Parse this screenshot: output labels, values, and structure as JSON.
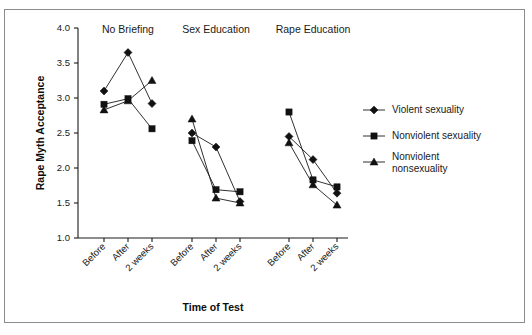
{
  "chart_data": {
    "type": "line",
    "title": "",
    "xlabel": "Time of Test",
    "ylabel": "Rape Myth Acceptance",
    "ylim": [
      1.0,
      4.0
    ],
    "ytick_labels": [
      "4.0",
      "3.5",
      "3.0",
      "2.5",
      "2.0",
      "1.5",
      "1.0"
    ],
    "ytick_values": [
      4.0,
      3.5,
      3.0,
      2.5,
      2.0,
      1.5,
      1.0
    ],
    "grid": false,
    "legend_position": "right",
    "categories": [
      "Before",
      "After",
      "2 weeks"
    ],
    "panels": [
      {
        "name": "No Briefing",
        "series": [
          {
            "name": "Violent sexuality",
            "marker": "diamond",
            "values": [
              3.1,
              3.65,
              2.92
            ]
          },
          {
            "name": "Nonviolent sexuality",
            "marker": "square",
            "values": [
              2.91,
              2.99,
              2.56
            ]
          },
          {
            "name": "Nonviolent nonsexuality",
            "marker": "triangle",
            "values": [
              2.83,
              2.96,
              3.25
            ]
          }
        ]
      },
      {
        "name": "Sex Education",
        "series": [
          {
            "name": "Violent sexuality",
            "marker": "diamond",
            "values": [
              2.5,
              2.3,
              1.52
            ]
          },
          {
            "name": "Nonviolent sexuality",
            "marker": "square",
            "values": [
              2.39,
              1.69,
              1.66
            ]
          },
          {
            "name": "Nonviolent nonsexuality",
            "marker": "triangle",
            "values": [
              2.7,
              1.57,
              1.5
            ]
          }
        ]
      },
      {
        "name": "Rape Education",
        "series": [
          {
            "name": "Violent sexuality",
            "marker": "diamond",
            "values": [
              2.45,
              2.12,
              1.64
            ]
          },
          {
            "name": "Nonviolent sexuality",
            "marker": "square",
            "values": [
              2.8,
              1.83,
              1.73
            ]
          },
          {
            "name": "Nonviolent nonsexuality",
            "marker": "triangle",
            "values": [
              2.36,
              1.76,
              1.47
            ]
          }
        ]
      }
    ],
    "legend": [
      {
        "label": "Violent sexuality",
        "marker": "diamond"
      },
      {
        "label": "Nonviolent sexuality",
        "marker": "square"
      },
      {
        "label": "Nonviolent nonsexuality",
        "marker": "triangle"
      }
    ],
    "colors": {
      "marker": "#111111",
      "line": "#1a1a1a",
      "axis": "#1a1a1a",
      "frame": "#8c8c8c",
      "background": "#ffffff"
    }
  }
}
